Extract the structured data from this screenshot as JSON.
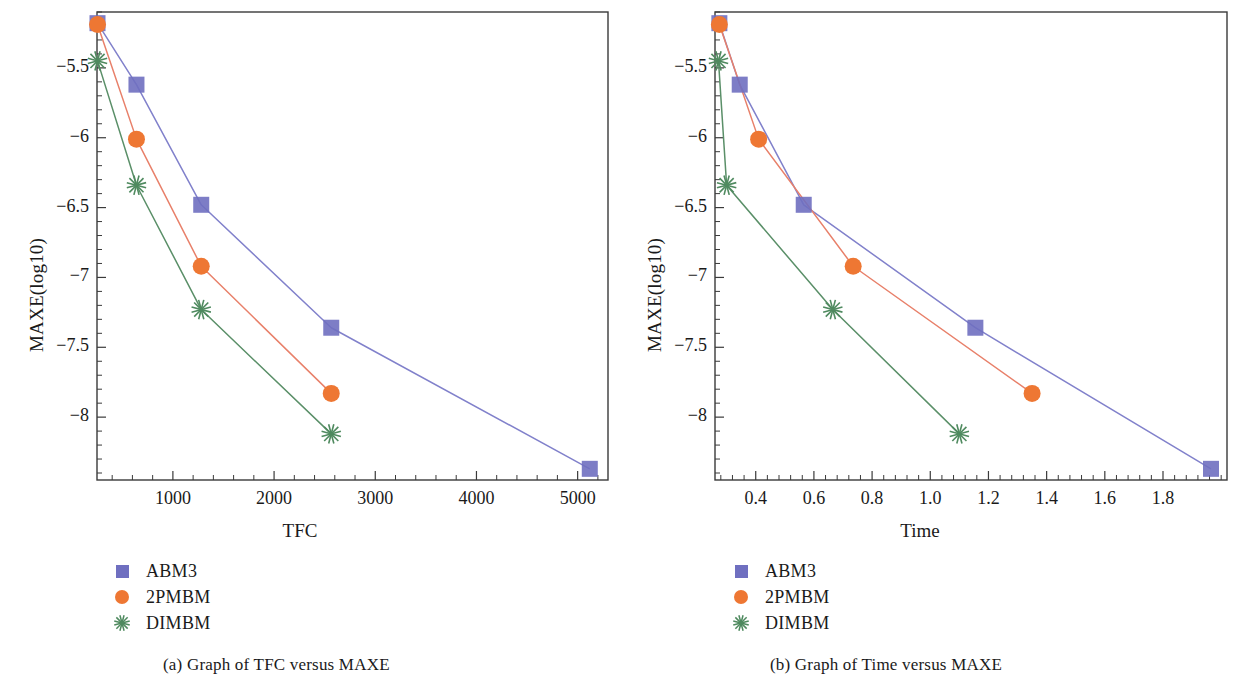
{
  "figure": {
    "panels": [
      {
        "id": "panel-a",
        "caption": "(a)  Graph of TFC versus MAXE",
        "xlabel": "TFC",
        "ylabel": "MAXE(log10)",
        "legend": [
          {
            "label": "ABM3",
            "marker": "square",
            "color": "#6f6fc0"
          },
          {
            "label": "2PMBM",
            "marker": "circle",
            "color": "#ee7733"
          },
          {
            "label": "DIMBM",
            "marker": "star",
            "color": "#4f8a5f"
          }
        ]
      },
      {
        "id": "panel-b",
        "caption": "(b)  Graph of Time versus MAXE",
        "xlabel": "Time",
        "ylabel": "MAXE(log10)",
        "legend": [
          {
            "label": "ABM3",
            "marker": "square",
            "color": "#6f6fc0"
          },
          {
            "label": "2PMBM",
            "marker": "circle",
            "color": "#ee7733"
          },
          {
            "label": "DIMBM",
            "marker": "star",
            "color": "#4f8a5f"
          }
        ]
      }
    ]
  },
  "chart_data": [
    {
      "type": "line",
      "title": "(a)  Graph of TFC versus MAXE",
      "xlabel": "TFC",
      "ylabel": "MAXE(log10)",
      "xlim": [
        250,
        5300
      ],
      "ylim": [
        -8.45,
        -5.1
      ],
      "xticks": [
        1000,
        2000,
        3000,
        4000,
        5000
      ],
      "xticklabels": [
        "1000",
        "2000",
        "3000",
        "4000",
        "5000"
      ],
      "yticks": [
        -5.5,
        -6,
        -6.5,
        -7,
        -7.5,
        -8
      ],
      "yticklabels": [
        "−5.5",
        "−6",
        "−6.5",
        "−7",
        "−7.5",
        "−8"
      ],
      "grid": false,
      "legend_position": "below-left",
      "series": [
        {
          "name": "ABM3",
          "marker": "square",
          "color": "#6f6fc0",
          "line_color": "#8181cb",
          "x": [
            255,
            640,
            1280,
            2565,
            5120
          ],
          "y": [
            -5.18,
            -5.62,
            -6.48,
            -7.36,
            -8.37
          ]
        },
        {
          "name": "2PMBM",
          "marker": "circle",
          "color": "#ee7733",
          "line_color": "#e8806a",
          "x": [
            255,
            640,
            1280,
            2565
          ],
          "y": [
            -5.19,
            -6.01,
            -6.92,
            -7.83
          ]
        },
        {
          "name": "DIMBM",
          "marker": "star",
          "color": "#4f8a5f",
          "line_color": "#5a8f68",
          "x": [
            255,
            640,
            1280,
            2565
          ],
          "y": [
            -5.45,
            -6.34,
            -7.23,
            -8.12
          ]
        }
      ]
    },
    {
      "type": "line",
      "title": "(b)  Graph of Time versus MAXE",
      "xlabel": "Time",
      "ylabel": "MAXE(log10)",
      "xlim": [
        0.26,
        2.02
      ],
      "ylim": [
        -8.45,
        -5.1
      ],
      "xticks": [
        0.4,
        0.6,
        0.8,
        1.0,
        1.2,
        1.4,
        1.6,
        1.8
      ],
      "xticklabels": [
        "0.4",
        "0.6",
        "0.8",
        "1.0",
        "1.2",
        "1.4",
        "1.6",
        "1.8"
      ],
      "yticks": [
        -5.5,
        -6,
        -6.5,
        -7,
        -7.5,
        -8
      ],
      "yticklabels": [
        "−5.5",
        "−6",
        "−6.5",
        "−7",
        "−7.5",
        "−8"
      ],
      "grid": false,
      "legend_position": "below-left",
      "series": [
        {
          "name": "ABM3",
          "marker": "square",
          "color": "#6f6fc0",
          "line_color": "#8181cb",
          "x": [
            0.275,
            0.345,
            0.565,
            1.155,
            1.965
          ],
          "y": [
            -5.18,
            -5.62,
            -6.48,
            -7.36,
            -8.37
          ]
        },
        {
          "name": "2PMBM",
          "marker": "circle",
          "color": "#ee7733",
          "line_color": "#e8806a",
          "x": [
            0.275,
            0.41,
            0.735,
            1.35
          ],
          "y": [
            -5.19,
            -6.01,
            -6.92,
            -7.83
          ]
        },
        {
          "name": "DIMBM",
          "marker": "star",
          "color": "#4f8a5f",
          "line_color": "#5a8f68",
          "x": [
            0.272,
            0.3,
            0.665,
            1.1
          ],
          "y": [
            -5.45,
            -6.34,
            -7.23,
            -8.12
          ]
        }
      ]
    }
  ]
}
